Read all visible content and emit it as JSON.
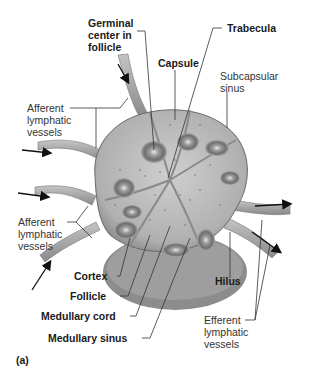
{
  "figure": {
    "panel_label": "(a)",
    "labels": {
      "germinal_center": "Germinal\ncenter in\nfollicle",
      "trabecula": "Trabecula",
      "capsule": "Capsule",
      "subcapsular_sinus": "Subcapsular\nsinus",
      "afferent_top": "Afferent\nlymphatic\nvessels",
      "afferent_bottom": "Afferent\nlymphatic\nvessels",
      "cortex": "Cortex",
      "follicle": "Follicle",
      "medullary_cord": "Medullary cord",
      "medullary_sinus": "Medullary sinus",
      "hilus": "Hilus",
      "efferent": "Efferent\nlymphatic\nvessels"
    },
    "colors": {
      "background": "#ffffff",
      "node_fill": "#b8b8b8",
      "node_dark": "#7a7a7a",
      "medulla_base": "#8c8c8c",
      "vessel": "#a6a6a6",
      "leader_line": "#333333",
      "arrow": "#111111"
    }
  }
}
